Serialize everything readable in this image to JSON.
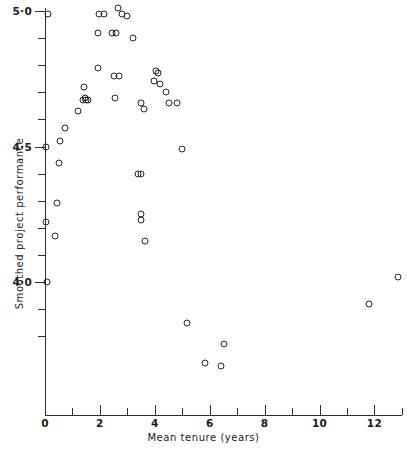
{
  "chart_data": {
    "type": "scatter",
    "title": "",
    "xlabel": "Mean tenure (years)",
    "ylabel": "Smoothed project performance",
    "xlim": [
      0,
      13
    ],
    "ylim": [
      3.75,
      5.07
    ],
    "grid": false,
    "legend": null,
    "marker": "open-circle",
    "x_ticks_major": [
      0,
      2,
      4,
      6,
      8,
      10,
      12
    ],
    "x_tick_labels": [
      "0",
      "2",
      "4",
      "6",
      "8",
      "10",
      "12"
    ],
    "x_ticks_minor": [
      1,
      3,
      5,
      7,
      9,
      11,
      13
    ],
    "y_ticks_major": [
      4.0,
      4.5,
      5.0
    ],
    "y_tick_labels": [
      "4·0",
      "4·5",
      "5·0"
    ],
    "y_ticks_minor": [
      3.8,
      3.9,
      4.1,
      4.2,
      4.3,
      4.4,
      4.6,
      4.7,
      4.8,
      4.9
    ],
    "points": [
      {
        "x": 0.1,
        "y": 4.99
      },
      {
        "x": 1.98,
        "y": 4.99
      },
      {
        "x": 2.15,
        "y": 4.99
      },
      {
        "x": 2.67,
        "y": 5.01
      },
      {
        "x": 2.82,
        "y": 4.99
      },
      {
        "x": 3.0,
        "y": 4.98
      },
      {
        "x": 1.92,
        "y": 4.92
      },
      {
        "x": 2.45,
        "y": 4.92
      },
      {
        "x": 2.6,
        "y": 4.92
      },
      {
        "x": 3.22,
        "y": 4.9
      },
      {
        "x": 1.92,
        "y": 4.79
      },
      {
        "x": 2.53,
        "y": 4.76
      },
      {
        "x": 2.68,
        "y": 4.76
      },
      {
        "x": 4.05,
        "y": 4.78
      },
      {
        "x": 4.12,
        "y": 4.77
      },
      {
        "x": 3.98,
        "y": 4.74
      },
      {
        "x": 4.18,
        "y": 4.73
      },
      {
        "x": 1.42,
        "y": 4.72
      },
      {
        "x": 1.45,
        "y": 4.68
      },
      {
        "x": 1.38,
        "y": 4.67
      },
      {
        "x": 1.5,
        "y": 4.67
      },
      {
        "x": 1.55,
        "y": 4.67
      },
      {
        "x": 2.55,
        "y": 4.68
      },
      {
        "x": 4.4,
        "y": 4.7
      },
      {
        "x": 4.52,
        "y": 4.66
      },
      {
        "x": 3.48,
        "y": 4.66
      },
      {
        "x": 3.62,
        "y": 4.64
      },
      {
        "x": 4.8,
        "y": 4.66
      },
      {
        "x": 1.22,
        "y": 4.63
      },
      {
        "x": 0.72,
        "y": 4.57
      },
      {
        "x": 0.55,
        "y": 4.52
      },
      {
        "x": 0.05,
        "y": 4.5
      },
      {
        "x": 4.98,
        "y": 4.49
      },
      {
        "x": 0.5,
        "y": 4.44
      },
      {
        "x": 3.38,
        "y": 4.4
      },
      {
        "x": 3.5,
        "y": 4.4
      },
      {
        "x": 0.42,
        "y": 4.29
      },
      {
        "x": 3.48,
        "y": 4.25
      },
      {
        "x": 3.48,
        "y": 4.23
      },
      {
        "x": 0.05,
        "y": 4.22
      },
      {
        "x": 0.38,
        "y": 4.17
      },
      {
        "x": 3.65,
        "y": 4.15
      },
      {
        "x": 0.08,
        "y": 4.0
      },
      {
        "x": 12.85,
        "y": 4.02
      },
      {
        "x": 11.8,
        "y": 3.92
      },
      {
        "x": 5.18,
        "y": 3.85
      },
      {
        "x": 6.52,
        "y": 3.77
      },
      {
        "x": 5.82,
        "y": 3.7
      },
      {
        "x": 6.4,
        "y": 3.69
      }
    ]
  }
}
